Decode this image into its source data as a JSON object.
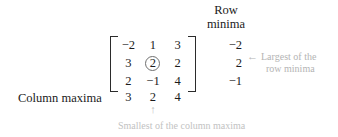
{
  "headers": {
    "row_minima_line1": "Row",
    "row_minima_line2": "minima"
  },
  "matrix": {
    "rows": [
      [
        "−2",
        "1",
        "3"
      ],
      [
        "3",
        "2",
        "2"
      ],
      [
        "2",
        "−1",
        "4"
      ]
    ],
    "circled_cell": {
      "row": 1,
      "col": 1,
      "value": "2"
    },
    "bracket_style": "square"
  },
  "row_minima": {
    "values": [
      "−2",
      "2",
      "−1"
    ]
  },
  "column_maxima": {
    "label": "Column maxima",
    "values": [
      "3",
      "2",
      "4"
    ]
  },
  "annotations": {
    "right": {
      "arrow_icon": "←",
      "line1": "Largest of the",
      "line2": "row minima",
      "color": "#b4b4b4"
    },
    "bottom": {
      "arrow_icon": "↑",
      "text": "Smallest of the column maxima",
      "color": "#c2c2c2"
    }
  },
  "colors": {
    "background": "#ffffff",
    "text": "#1b1b1b",
    "bracket": "#2b2b2b",
    "circle": "#6f6f6f",
    "annotation_gray": "#bdbdbd"
  }
}
